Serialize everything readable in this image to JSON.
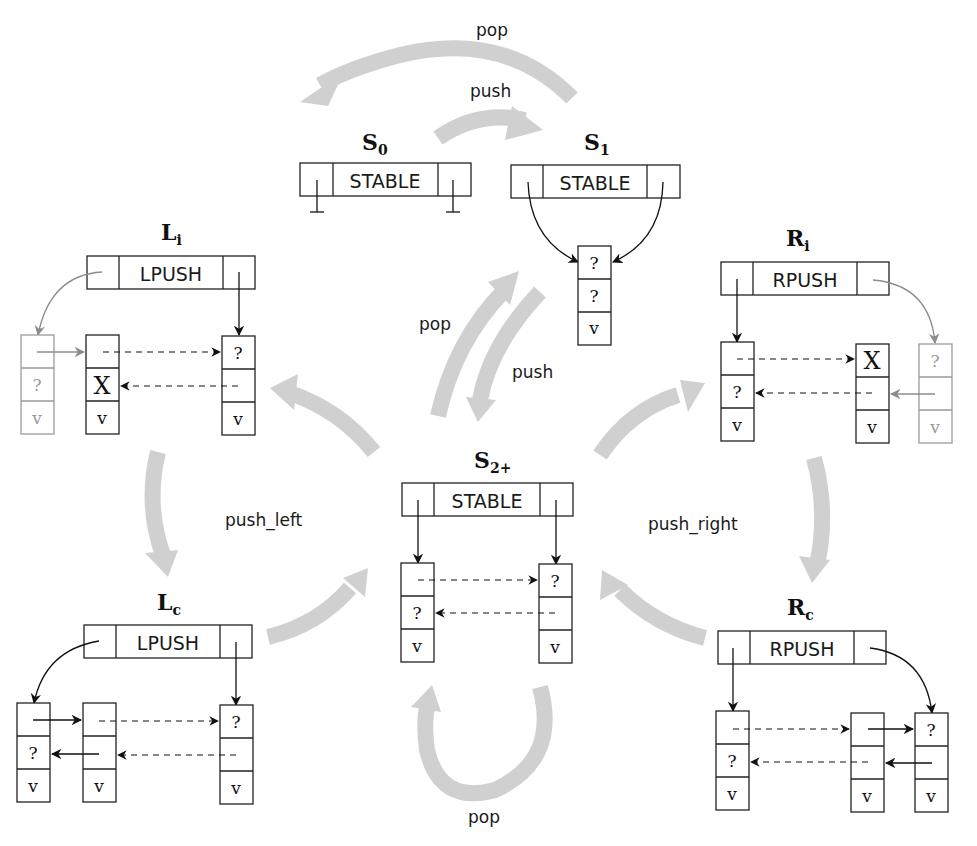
{
  "states": {
    "s0": {
      "name": "S",
      "sub": "0",
      "header": "STABLE"
    },
    "s1": {
      "name": "S",
      "sub": "1",
      "header": "STABLE"
    },
    "s2": {
      "name": "S",
      "sub": "2+",
      "header": "STABLE"
    },
    "li": {
      "name": "L",
      "sub": "i",
      "header": "LPUSH"
    },
    "lc": {
      "name": "L",
      "sub": "c",
      "header": "LPUSH"
    },
    "ri": {
      "name": "R",
      "sub": "i",
      "header": "RPUSH"
    },
    "rc": {
      "name": "R",
      "sub": "c",
      "header": "RPUSH"
    }
  },
  "cells": {
    "q": "?",
    "v": "v",
    "x": "X"
  },
  "transitions": {
    "s1_to_s0": "pop",
    "s0_to_s1": "push",
    "s2_to_s1": "pop",
    "s1_to_s2": "push",
    "left_cycle": "push_left",
    "right_cycle": "push_right",
    "s2_self": "pop"
  },
  "colors": {
    "flow_arrow": "#d0d0d0",
    "node_stroke": "#222222",
    "ghost_stroke": "#9a9a9a"
  }
}
